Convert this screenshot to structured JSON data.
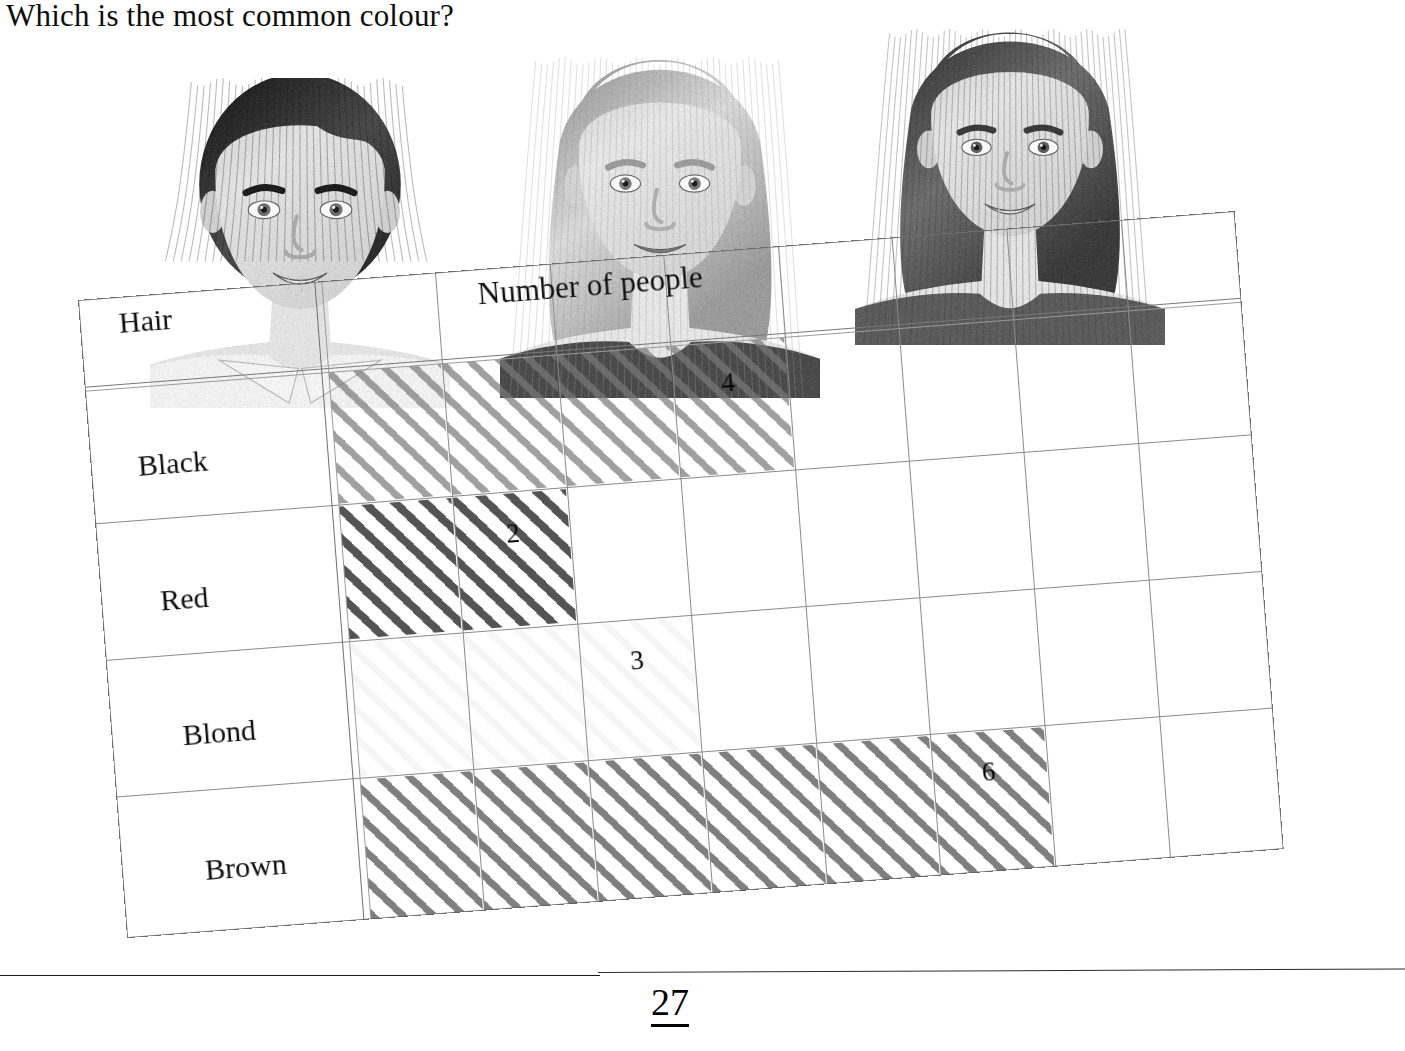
{
  "question": "Which is the most common colour?",
  "page_number": "27",
  "table": {
    "row_header_label": "Hair",
    "column_header_label": "Number of people",
    "column_count": 8,
    "rows": [
      {
        "label": "Black",
        "value": "4",
        "shade": "light"
      },
      {
        "label": "Red",
        "value": "2",
        "shade": "dark"
      },
      {
        "label": "Blond",
        "value": "3",
        "shade": "erased"
      },
      {
        "label": "Brown",
        "value": "6",
        "shade": "mid"
      }
    ]
  },
  "photos": [
    {
      "name": "boy-black-hair",
      "hair": "black"
    },
    {
      "name": "girl-blond-hair",
      "hair": "blond"
    },
    {
      "name": "girl-brown-hair",
      "hair": "brown"
    }
  ],
  "chart_data": {
    "type": "bar",
    "title": "Number of people",
    "xlabel": "Number of people",
    "ylabel": "Hair",
    "categories": [
      "Black",
      "Red",
      "Blond",
      "Brown"
    ],
    "values": [
      4,
      2,
      3,
      6
    ],
    "xlim": [
      0,
      8
    ],
    "grid": true,
    "orientation": "horizontal",
    "note": "Blond row shading is erased; only the numeral 3 is written"
  }
}
